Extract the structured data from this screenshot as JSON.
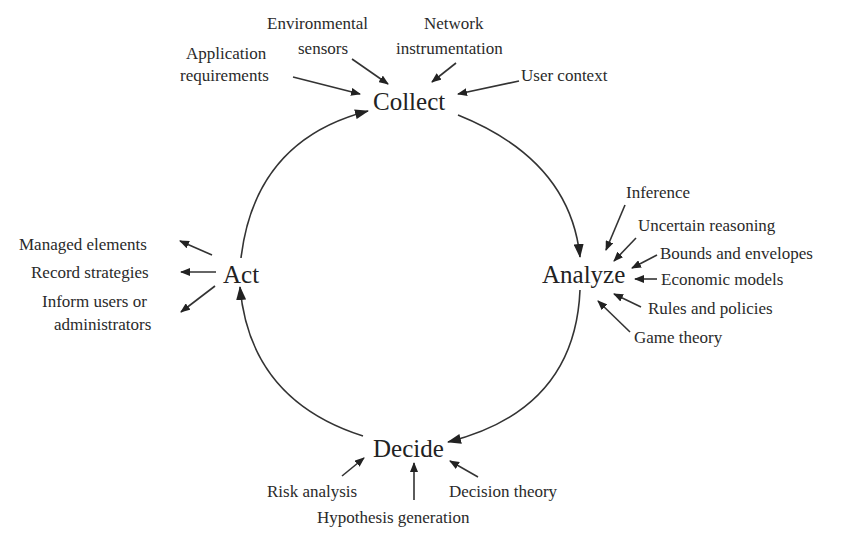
{
  "diagram": {
    "type": "cycle",
    "colors": {
      "ink": "#222222",
      "background": "#ffffff"
    },
    "stages": {
      "collect": "Collect",
      "analyze": "Analyze",
      "decide": "Decide",
      "act": "Act"
    },
    "cycle_order": [
      "Collect",
      "Analyze",
      "Decide",
      "Act"
    ],
    "collect_inputs": {
      "application_requirements": [
        "Application",
        "requirements"
      ],
      "environmental_sensors": [
        "Environmental",
        "sensors"
      ],
      "network_instrumentation": [
        "Network",
        "instrumentation"
      ],
      "user_context": "User context"
    },
    "analyze_inputs": {
      "inference": "Inference",
      "uncertain_reasoning": "Uncertain reasoning",
      "bounds_and_envelopes": "Bounds and envelopes",
      "economic_models": "Economic models",
      "rules_and_policies": "Rules and policies",
      "game_theory": "Game theory"
    },
    "decide_inputs": {
      "risk_analysis": "Risk analysis",
      "hypothesis_generation": "Hypothesis generation",
      "decision_theory": "Decision theory"
    },
    "act_outputs": {
      "managed_elements": "Managed elements",
      "record_strategies": "Record strategies",
      "inform_users": [
        "Inform users or",
        "administrators"
      ]
    }
  }
}
